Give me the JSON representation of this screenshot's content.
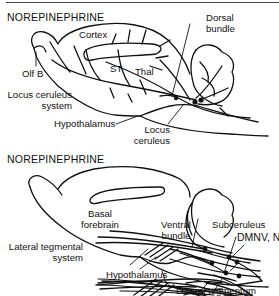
{
  "figure": {
    "panels": [
      {
        "title": "NOREPINEPHRINE",
        "labels": {
          "cortex": "Cortex",
          "st": "ST",
          "thal": "Thal",
          "olf_b": "Olf B",
          "system_name_line1": "Locus ceruleus",
          "system_name_line2": "system",
          "hypothalamus": "Hypothalamus",
          "dorsal_bundle_line1": "Dorsal",
          "dorsal_bundle_line2": "bundle",
          "locus_line1": "Locus",
          "locus_line2": "ceruleus"
        }
      },
      {
        "title": "NOREPINEPHRINE",
        "labels": {
          "basal_line1": "Basal",
          "basal_line2": "forebrain",
          "system_name_line1": "Lateral tegmental",
          "system_name_line2": "system",
          "hypothalamus": "Hypothalamus",
          "ventral_line1": "Ventral",
          "ventral_line2": "bundle",
          "subceruleus": "Subceruleus",
          "dmnv_nts": "DMNV, NTS",
          "lateral_tegmentum": "Lateral tegmentum"
        }
      }
    ]
  }
}
